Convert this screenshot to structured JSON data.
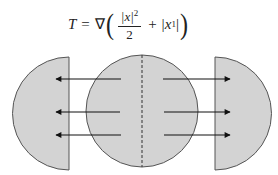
{
  "formula": {
    "lhs": "T",
    "equals": "=",
    "operator": "∇",
    "open_paren": "(",
    "numerator_abs": "|x|",
    "numerator_exp": "2",
    "denominator": "2",
    "plus": "+",
    "term2_open": "|x",
    "term2_sub": "1",
    "term2_close": "|",
    "close_paren": ")"
  },
  "diagram": {
    "fill_color": "#d3d3d3",
    "stroke_color": "#555555",
    "arrow_color": "#111111",
    "center_disc": {
      "cx": 142,
      "cy": 111,
      "r": 56
    },
    "left_half_disc": {
      "flat_x": 69,
      "cy": 113,
      "r": 56
    },
    "right_half_disc": {
      "flat_x": 215,
      "cy": 113,
      "r": 56
    },
    "arrow_rows_y": [
      79,
      112,
      135
    ],
    "left_arrows_direction": "left",
    "right_arrows_direction": "right"
  }
}
